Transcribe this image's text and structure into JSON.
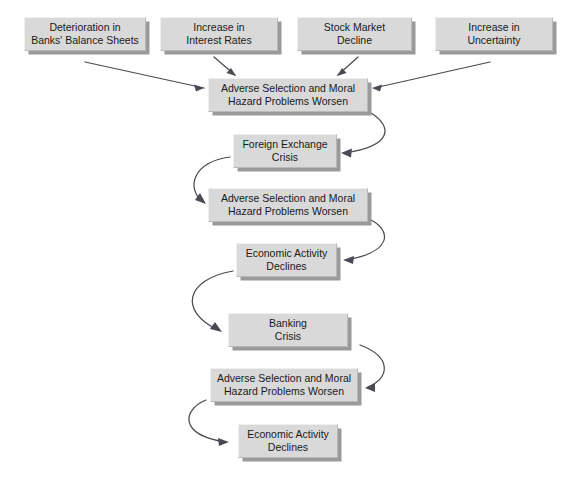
{
  "diagram": {
    "type": "flowchart",
    "background_color": "#ffffff",
    "node_fill_color": "#d9d9d9",
    "node_shadow_color": "#9a9a9a",
    "arrow_color": "#4a4a52"
  },
  "nodes": [
    {
      "id": "deterioration-banks-balance-sheets",
      "label": "Deterioration in\nBanks' Balance Sheets",
      "x": 24,
      "y": 17,
      "w": 122,
      "h": 34,
      "row": "causes"
    },
    {
      "id": "increase-interest-rates",
      "label": "Increase in\nInterest Rates",
      "x": 160,
      "y": 17,
      "w": 118,
      "h": 34,
      "row": "causes"
    },
    {
      "id": "stock-market-decline",
      "label": "Stock Market\nDecline",
      "x": 297,
      "y": 17,
      "w": 115,
      "h": 34,
      "row": "causes"
    },
    {
      "id": "increase-uncertainty",
      "label": "Increase in\nUncertainty",
      "x": 435,
      "y": 17,
      "w": 118,
      "h": 34,
      "row": "causes"
    },
    {
      "id": "adverse-selection-moral-hazard-1",
      "label": "Adverse Selection and Moral\nHazard Problems Worsen",
      "x": 208,
      "y": 78,
      "w": 160,
      "h": 34,
      "row": "stage-1"
    },
    {
      "id": "foreign-exchange-crisis",
      "label": "Foreign Exchange\nCrisis",
      "x": 233,
      "y": 134,
      "w": 104,
      "h": 34,
      "row": "stage-2"
    },
    {
      "id": "adverse-selection-moral-hazard-2",
      "label": "Adverse Selection and Moral\nHazard Problems Worsen",
      "x": 208,
      "y": 188,
      "w": 160,
      "h": 34,
      "row": "stage-3"
    },
    {
      "id": "economic-activity-declines-1",
      "label": "Economic Activity\nDeclines",
      "x": 236,
      "y": 243,
      "w": 101,
      "h": 34,
      "row": "stage-4"
    },
    {
      "id": "banking-crisis",
      "label": "Banking\nCrisis",
      "x": 228,
      "y": 313,
      "w": 120,
      "h": 34,
      "row": "stage-5"
    },
    {
      "id": "adverse-selection-moral-hazard-3",
      "label": "Adverse Selection and Moral\nHazard Problems Worsen",
      "x": 210,
      "y": 368,
      "w": 148,
      "h": 34,
      "row": "stage-6"
    },
    {
      "id": "economic-activity-declines-2",
      "label": "Economic Activity\nDeclines",
      "x": 238,
      "y": 424,
      "w": 100,
      "h": 34,
      "row": "stage-7"
    }
  ],
  "edges": [
    {
      "id": "edge-deterioration-to-as1",
      "from": "deterioration-banks-balance-sheets",
      "to": "adverse-selection-moral-hazard-1",
      "kind": "straight",
      "path": "M 85 62 L 204 88",
      "head": "204,88 194,84.5 196,91.5"
    },
    {
      "id": "edge-interest-rates-to-as1",
      "from": "increase-interest-rates",
      "to": "adverse-selection-moral-hazard-1",
      "kind": "straight",
      "path": "M 214 57 L 235 75",
      "head": "236,76 226.5,73 231,68"
    },
    {
      "id": "edge-stock-market-to-as1",
      "from": "stock-market-decline",
      "to": "adverse-selection-moral-hazard-1",
      "kind": "straight",
      "path": "M 358 57 L 338 75",
      "head": "337,76 342,68 346.5,73"
    },
    {
      "id": "edge-uncertainty-to-as1",
      "from": "increase-uncertainty",
      "to": "adverse-selection-moral-hazard-1",
      "kind": "straight",
      "path": "M 490 62 L 374 88",
      "head": "372,88 382,84.5 380,91.5"
    },
    {
      "id": "edge-as1-to-fx-crisis",
      "from": "adverse-selection-moral-hazard-1",
      "to": "foreign-exchange-crisis",
      "kind": "curve-right",
      "path": "M 371 113 C 392 126 394 146 344 153",
      "head": "341,153 352,148.5 351,157.5"
    },
    {
      "id": "edge-fx-crisis-to-as2",
      "from": "foreign-exchange-crisis",
      "to": "adverse-selection-moral-hazard-2",
      "kind": "curve-left",
      "path": "M 230 157 C 194 161 185 188 203 202",
      "head": "206,204 195,200 200,193"
    },
    {
      "id": "edge-as2-to-economic-activity-1",
      "from": "adverse-selection-moral-hazard-2",
      "to": "economic-activity-declines-1",
      "kind": "curve-right",
      "path": "M 371 220 C 392 231 392 252 346 260",
      "head": "343,260 354,256 353,264"
    },
    {
      "id": "edge-economic-activity-1-to-banking-crisis",
      "from": "economic-activity-declines-1",
      "to": "banking-crisis",
      "kind": "curve-left",
      "path": "M 233 271 C 186 279 178 311 218 330",
      "head": "222,332 210,329 215,322"
    },
    {
      "id": "edge-banking-crisis-to-as3",
      "from": "banking-crisis",
      "to": "adverse-selection-moral-hazard-3",
      "kind": "curve-right",
      "path": "M 360 345 C 392 357 390 378 368 387",
      "head": "365,388 375,383 375,392"
    },
    {
      "id": "edge-as3-to-economic-activity-2",
      "from": "adverse-selection-moral-hazard-3",
      "to": "economic-activity-declines-2",
      "kind": "curve-left",
      "path": "M 206 400 C 182 410 179 435 225 442",
      "head": "229,442 218,438 219,446"
    }
  ]
}
